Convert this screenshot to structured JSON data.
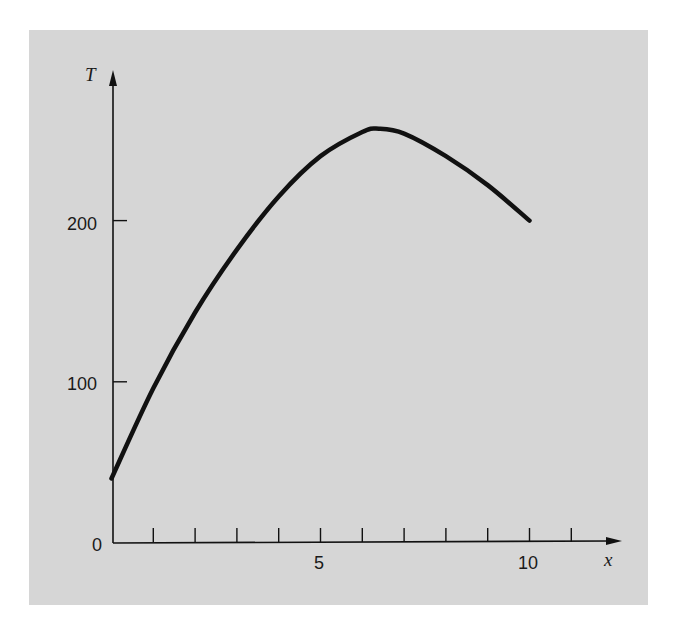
{
  "chart_data": {
    "type": "line",
    "title": "",
    "xlabel": "x",
    "ylabel": "T",
    "xlim": [
      0,
      11.5
    ],
    "ylim": [
      0,
      275
    ],
    "grid": false,
    "legend": null,
    "x_ticks": [
      1,
      2,
      3,
      4,
      5,
      6,
      7,
      8,
      9,
      10,
      11
    ],
    "x_tick_labels": [
      {
        "value": 5,
        "label": "5"
      },
      {
        "value": 10,
        "label": "10"
      }
    ],
    "y_ticks": [
      {
        "value": 0,
        "label": "0"
      },
      {
        "value": 100,
        "label": "100"
      },
      {
        "value": 200,
        "label": "200"
      }
    ],
    "series": [
      {
        "name": "T(x)",
        "x": [
          0,
          1,
          2,
          3,
          4,
          5,
          6,
          6.4,
          7,
          8,
          9,
          10
        ],
        "values": [
          40,
          96,
          143,
          182,
          215,
          240,
          255,
          257,
          254,
          240,
          222,
          200
        ]
      }
    ]
  },
  "labels": {
    "y_axis": "T",
    "x_axis": "x",
    "origin": "0",
    "y100": "100",
    "y200": "200",
    "x5": "5",
    "x10": "10"
  },
  "colors": {
    "panel": "#d6d6d6",
    "ink": "#111111"
  }
}
